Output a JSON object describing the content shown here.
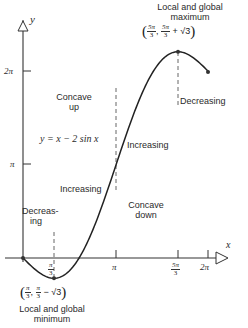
{
  "title": "y = x − 2 sin x",
  "equation_label": "y = x − 2 sin x",
  "axes": {
    "x_label": "x",
    "y_label": "y",
    "x_ticks": [
      {
        "label_num": "π",
        "label_den": "3"
      },
      {
        "label": "π"
      },
      {
        "label_num": "5π",
        "label_den": "3"
      },
      {
        "label": "2π"
      }
    ],
    "y_ticks": [
      {
        "label": "π"
      },
      {
        "label": "2π"
      }
    ]
  },
  "annotations": {
    "max_title_line1": "Local and global",
    "max_title_line2": "maximum",
    "max_coord_x_num": "5π",
    "max_coord_x_den": "3",
    "max_coord_y_num": "5π",
    "max_coord_y_den": "3",
    "max_coord_y_suffix": "+ √3",
    "min_title_line1": "Local and global",
    "min_title_line2": "minimum",
    "min_coord_x_num": "π",
    "min_coord_x_den": "3",
    "min_coord_y_num": "π",
    "min_coord_y_den": "3",
    "min_coord_y_suffix": "− √3",
    "concave_up_line1": "Concave",
    "concave_up_line2": "up",
    "concave_down_line1": "Concave",
    "concave_down_line2": "down",
    "decreasing_left_line1": "Decreas-",
    "decreasing_left_line2": "ing",
    "increasing_1": "Increasing",
    "increasing_2": "Increasing",
    "decreasing_right": "Decreasing"
  },
  "chart_data": {
    "type": "line",
    "title": "y = x − 2 sin x",
    "xlabel": "x",
    "ylabel": "y",
    "xlim": [
      0,
      6.2832
    ],
    "ylim": [
      -0.7,
      6.8
    ],
    "x_tick_labels": [
      "π/3",
      "π",
      "5π/3",
      "2π"
    ],
    "y_tick_labels": [
      "π",
      "2π"
    ],
    "series": [
      {
        "name": "y = x − 2 sin x",
        "x": [
          0,
          0.5236,
          1.0472,
          1.5708,
          2.0944,
          2.618,
          3.1416,
          3.6652,
          4.1888,
          4.7124,
          5.236,
          5.7596,
          6.2832
        ],
        "y": [
          0,
          -0.4764,
          -0.685,
          -0.4292,
          0.3623,
          1.618,
          3.1416,
          4.6652,
          5.9209,
          6.7124,
          6.9681,
          6.7596,
          6.2832
        ]
      }
    ],
    "key_points": [
      {
        "label": "Local and global minimum",
        "x": "π/3",
        "y": "π/3 − √3"
      },
      {
        "label": "Local and global maximum",
        "x": "5π/3",
        "y": "5π/3 + √3"
      },
      {
        "label": "Inflection",
        "x": "π",
        "y": "π"
      }
    ],
    "regions": [
      "Decreasing (0, π/3)",
      "Increasing (π/3, 5π/3)",
      "Decreasing (5π/3, 2π)",
      "Concave up (0, π)",
      "Concave down (π, 2π)"
    ]
  }
}
